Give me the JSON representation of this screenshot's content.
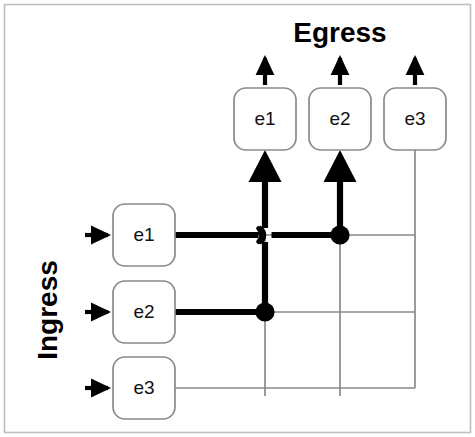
{
  "figure": {
    "kind": "crossbar-switch-diagram",
    "border_color": "#bfbfbf",
    "background": "#ffffff",
    "thick_stroke_color": "#000000",
    "thin_stroke_color": "#8a8a8a",
    "box_stroke_color": "#8a8a8a",
    "junction_fill": "#000000"
  },
  "labels": {
    "egress": "Egress",
    "ingress": "Ingress"
  },
  "egress_ports": [
    {
      "id": "egress-e1",
      "label": "e1",
      "column": 1,
      "x": 265,
      "has_output_arrow": true,
      "fed_by": "ingress-e2"
    },
    {
      "id": "egress-e2",
      "label": "e2",
      "column": 2,
      "x": 340,
      "has_output_arrow": true,
      "fed_by": "ingress-e1"
    },
    {
      "id": "egress-e3",
      "label": "e3",
      "column": 3,
      "x": 415,
      "has_output_arrow": true,
      "fed_by": ""
    }
  ],
  "ingress_ports": [
    {
      "id": "ingress-e1",
      "label": "e1",
      "row": 1,
      "y": 235,
      "has_input_arrow": true,
      "active_to_column": 2
    },
    {
      "id": "ingress-e2",
      "label": "e2",
      "row": 2,
      "y": 312,
      "has_input_arrow": true,
      "active_to_column": 1
    },
    {
      "id": "ingress-e3",
      "label": "e3",
      "row": 3,
      "y": 388,
      "has_input_arrow": true,
      "active_to_column": 0
    }
  ],
  "crosspoints": [
    {
      "id": "crosspoint-r1c1",
      "row": 1,
      "column": 1,
      "x": 265,
      "y": 235,
      "state": "hop-over",
      "state_label": "crossing (not connected)"
    },
    {
      "id": "crosspoint-r1c2",
      "row": 1,
      "column": 2,
      "x": 340,
      "y": 235,
      "state": "closed",
      "state_label": "connected"
    },
    {
      "id": "crosspoint-r1c3",
      "row": 1,
      "column": 3,
      "x": 415,
      "y": 235,
      "state": "open",
      "state_label": "not connected"
    },
    {
      "id": "crosspoint-r2c1",
      "row": 2,
      "column": 1,
      "x": 265,
      "y": 312,
      "state": "closed",
      "state_label": "connected"
    },
    {
      "id": "crosspoint-r2c2",
      "row": 2,
      "column": 2,
      "x": 340,
      "y": 312,
      "state": "open",
      "state_label": "not connected"
    },
    {
      "id": "crosspoint-r2c3",
      "row": 2,
      "column": 3,
      "x": 415,
      "y": 312,
      "state": "open",
      "state_label": "not connected"
    },
    {
      "id": "crosspoint-r3c1",
      "row": 3,
      "column": 1,
      "x": 265,
      "y": 388,
      "state": "open",
      "state_label": "not connected"
    },
    {
      "id": "crosspoint-r3c2",
      "row": 3,
      "column": 2,
      "x": 340,
      "y": 388,
      "state": "open",
      "state_label": "not connected"
    },
    {
      "id": "crosspoint-r3c3",
      "row": 3,
      "column": 3,
      "x": 415,
      "y": 388,
      "state": "corner",
      "state_label": "column terminus"
    }
  ],
  "geometry": {
    "columns_x": [
      265,
      340,
      415
    ],
    "rows_y": [
      235,
      312,
      388
    ],
    "ingress_box": {
      "x": 113,
      "width": 62,
      "height": 62,
      "radius": 12
    },
    "egress_box": {
      "y": 88,
      "width": 62,
      "height": 62,
      "radius": 12
    },
    "egress_box_bottom": 150,
    "ingress_arrow_x": 85,
    "egress_arrow_top": 57
  }
}
